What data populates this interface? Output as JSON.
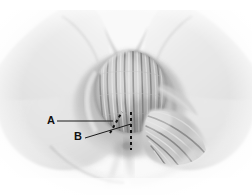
{
  "figure": {
    "kind": "anatomical-illustration",
    "style": "grayscale airbrush medical illustration",
    "background_color": "#ffffff",
    "width": 252,
    "height": 195
  },
  "labels": [
    {
      "id": "A",
      "text": "A",
      "x": 47,
      "y": 115
    },
    {
      "id": "B",
      "text": "B",
      "x": 74,
      "y": 131
    }
  ],
  "leader_lines": [
    {
      "for": "A",
      "from": [
        57,
        121
      ],
      "to": [
        113,
        121
      ],
      "style": "solid",
      "color": "#1a1a1a"
    },
    {
      "for": "B",
      "from": [
        85,
        138
      ],
      "to": [
        131,
        124
      ],
      "style": "solid",
      "color": "#1a1a1a"
    }
  ],
  "markers": [
    {
      "for": "A",
      "style": "dashed",
      "orientation": "diagonal",
      "from": [
        110,
        133
      ],
      "to": [
        121,
        113
      ],
      "color": "#121212"
    },
    {
      "for": "B",
      "style": "dashed",
      "orientation": "vertical",
      "from": [
        131,
        112
      ],
      "to": [
        131,
        150
      ],
      "color": "#121212"
    }
  ],
  "palette": {
    "skin_light": "#f2f2f2",
    "skin_mid": "#d9d9d9",
    "skin_shadow": "#b4b4b4",
    "skin_deep_shadow": "#8f8f8f",
    "fiber_light": "#e4e4e4",
    "fiber_dark": "#767676",
    "line": "#1a1a1a"
  }
}
